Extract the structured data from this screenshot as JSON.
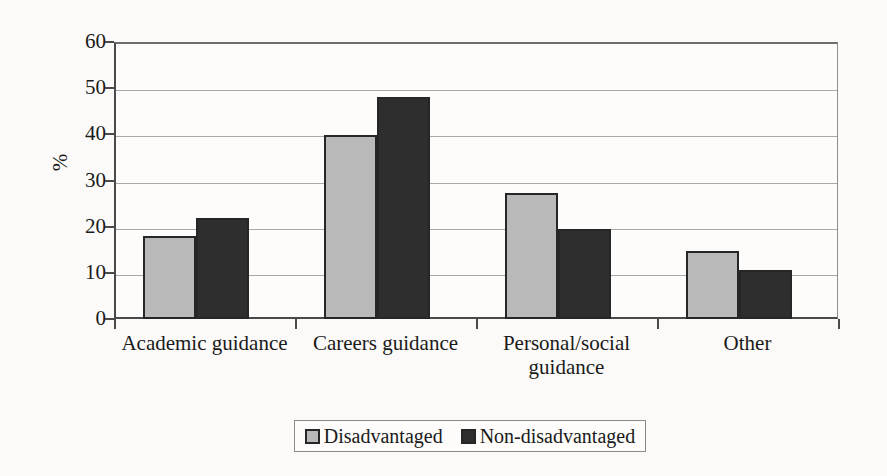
{
  "chart_data": {
    "type": "bar",
    "title": "",
    "subtitle": "",
    "xlabel": "",
    "ylabel": "%",
    "ylim": [
      0,
      60
    ],
    "ytick_step": 10,
    "ytick_labels": [
      "60",
      "50",
      "40",
      "30",
      "20",
      "10",
      "0"
    ],
    "ytick_values": [
      60,
      50,
      40,
      30,
      20,
      10,
      0
    ],
    "grid": true,
    "legend_position": "bottom",
    "categories": [
      "Academic guidance",
      "Careers guidance",
      "Personal/social guidance",
      "Other"
    ],
    "category_lines": [
      [
        "Academic guidance"
      ],
      [
        "Careers guidance"
      ],
      [
        "Personal/social",
        "guidance"
      ],
      [
        "Other"
      ]
    ],
    "series": [
      {
        "name": "Disadvantaged",
        "color": "#b9b9b9",
        "values": [
          18.0,
          39.8,
          27.3,
          14.8
        ]
      },
      {
        "name": "Non-disadvantaged",
        "color": "#2e2e2e",
        "values": [
          21.8,
          48.0,
          19.5,
          10.7
        ]
      }
    ]
  },
  "legend": {
    "items": [
      {
        "label": "Disadvantaged",
        "swatch": "light"
      },
      {
        "label": "Non-disadvantaged",
        "swatch": "dark"
      }
    ]
  }
}
